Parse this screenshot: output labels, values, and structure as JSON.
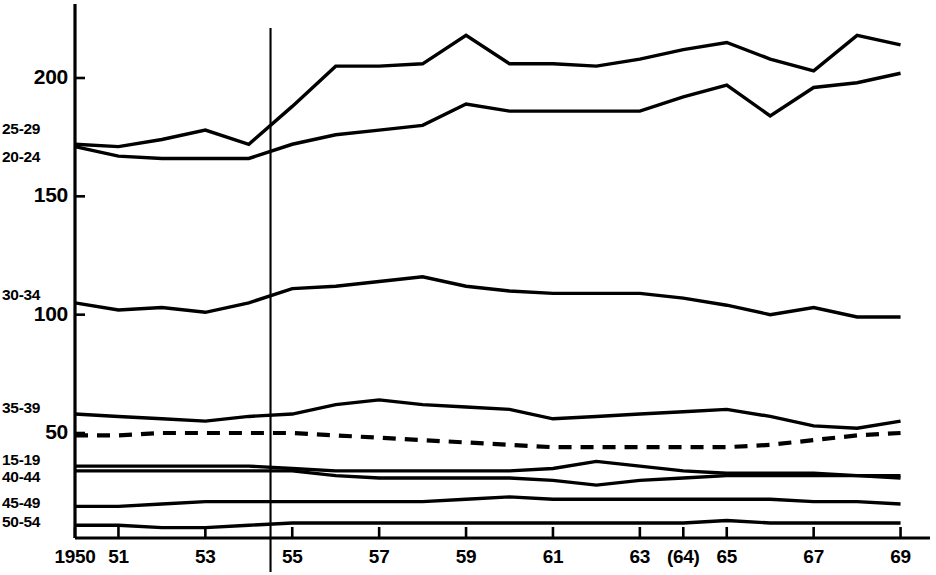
{
  "chart_data": {
    "type": "line",
    "title": "",
    "subtitle": "",
    "xlabel": "",
    "ylabel": "",
    "grid": false,
    "legend_position": "left-axis-inline",
    "xlim": [
      1950,
      1969
    ],
    "ylim": [
      0,
      230
    ],
    "x": [
      1950,
      1951,
      1952,
      1953,
      1954,
      1955,
      1956,
      1957,
      1958,
      1959,
      1960,
      1961,
      1962,
      1963,
      1964,
      1965,
      1966,
      1967,
      1968,
      1969
    ],
    "x_tick_values": [
      1950,
      1951,
      1953,
      1955,
      1957,
      1959,
      1961,
      1963,
      1964,
      1965,
      1967,
      1969
    ],
    "x_tick_labels": [
      "1950",
      "51",
      "53",
      "55",
      "57",
      "59",
      "61",
      "63",
      "(64)",
      "65",
      "67",
      "69"
    ],
    "y_tick_values": [
      50,
      100,
      150,
      200
    ],
    "y_tick_labels": [
      "50",
      "100",
      "150",
      "200"
    ],
    "annotations": [
      {
        "name": "vertical-reference-line",
        "type": "vline",
        "x": 1954.5,
        "style": "solid"
      }
    ],
    "series": [
      {
        "name": "25-29",
        "label": "25-29",
        "style": "solid",
        "label_y_value": 178,
        "values": [
          172,
          171,
          174,
          178,
          172,
          188,
          205,
          205,
          206,
          218,
          206,
          206,
          205,
          208,
          212,
          215,
          208,
          203,
          218,
          214
        ]
      },
      {
        "name": "20-24",
        "label": "20-24",
        "style": "solid",
        "label_y_value": 166,
        "values": [
          171,
          167,
          166,
          166,
          166,
          172,
          176,
          178,
          180,
          189,
          186,
          186,
          186,
          186,
          192,
          197,
          184,
          196,
          198,
          202
        ]
      },
      {
        "name": "30-34",
        "label": "30-34",
        "style": "solid",
        "label_y_value": 108,
        "values": [
          105,
          102,
          103,
          101,
          105,
          111,
          112,
          114,
          116,
          112,
          110,
          109,
          109,
          109,
          107,
          104,
          100,
          103,
          99,
          99
        ]
      },
      {
        "name": "35-39",
        "label": "35-39",
        "style": "solid",
        "label_y_value": 60,
        "values": [
          58,
          57,
          56,
          55,
          57,
          58,
          62,
          64,
          62,
          61,
          60,
          56,
          57,
          58,
          59,
          60,
          57,
          53,
          52,
          55
        ]
      },
      {
        "name": "total-dashed-reference",
        "label": "",
        "style": "dashed",
        "label_y_value": 49,
        "values": [
          49,
          49,
          50,
          50,
          50,
          50,
          49,
          48,
          47,
          46,
          45,
          44,
          44,
          44,
          44,
          44,
          45,
          47,
          49,
          50
        ]
      },
      {
        "name": "15-19",
        "label": "15-19",
        "style": "solid",
        "label_y_value": 38,
        "values": [
          36,
          36,
          36,
          36,
          36,
          35,
          34,
          34,
          34,
          34,
          34,
          35,
          38,
          36,
          34,
          33,
          33,
          33,
          32,
          32
        ]
      },
      {
        "name": "40-44",
        "label": "40-44",
        "style": "solid",
        "label_y_value": 31,
        "values": [
          34,
          34,
          34,
          34,
          34,
          34,
          32,
          31,
          31,
          31,
          31,
          30,
          28,
          30,
          31,
          32,
          32,
          32,
          32,
          31
        ]
      },
      {
        "name": "45-49",
        "label": "45-49",
        "style": "solid",
        "label_y_value": 20,
        "values": [
          19,
          19,
          20,
          21,
          21,
          21,
          21,
          21,
          21,
          22,
          23,
          22,
          22,
          22,
          22,
          22,
          22,
          21,
          21,
          20
        ]
      },
      {
        "name": "50-54",
        "label": "50-54",
        "style": "solid",
        "label_y_value": 12,
        "values": [
          11,
          11,
          10,
          10,
          11,
          12,
          12,
          12,
          12,
          12,
          12,
          12,
          12,
          12,
          12,
          13,
          12,
          12,
          12,
          12
        ]
      }
    ]
  },
  "axes": {
    "y_labels": [
      {
        "text": "200",
        "y_value": 200
      },
      {
        "text": "150",
        "y_value": 150
      },
      {
        "text": "100",
        "y_value": 100
      },
      {
        "text": "50",
        "y_value": 50
      }
    ],
    "x_labels": [
      {
        "text": "1950",
        "x_value": 1950
      },
      {
        "text": "51",
        "x_value": 1951
      },
      {
        "text": "53",
        "x_value": 1953
      },
      {
        "text": "55",
        "x_value": 1955
      },
      {
        "text": "57",
        "x_value": 1957
      },
      {
        "text": "59",
        "x_value": 1959
      },
      {
        "text": "61",
        "x_value": 1961
      },
      {
        "text": "63",
        "x_value": 1963
      },
      {
        "text": "(64)",
        "x_value": 1964
      },
      {
        "text": "65",
        "x_value": 1965
      },
      {
        "text": "67",
        "x_value": 1967
      },
      {
        "text": "69",
        "x_value": 1969
      }
    ],
    "series_labels": [
      {
        "text": "25-29",
        "y_value": 178
      },
      {
        "text": "20-24",
        "y_value": 166
      },
      {
        "text": "30-34",
        "y_value": 108
      },
      {
        "text": "35-39",
        "y_value": 60
      },
      {
        "text": "15-19",
        "y_value": 38
      },
      {
        "text": "40-44",
        "y_value": 31
      },
      {
        "text": "45-49",
        "y_value": 20
      },
      {
        "text": "50-54",
        "y_value": 12
      }
    ]
  },
  "style": {
    "line_color": "#000000",
    "axis_color": "#000000",
    "background": "#ffffff"
  }
}
